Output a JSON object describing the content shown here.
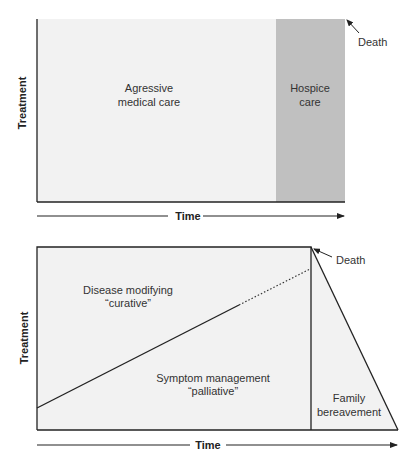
{
  "colors": {
    "background": "#ffffff",
    "region_fill": "#f2f2f2",
    "hospice_fill": "#c0c0c0",
    "line": "#222222",
    "text": "#333333"
  },
  "top_diagram": {
    "y_axis_label": "Treatment",
    "x_axis_label": "Time",
    "regions": [
      {
        "id": "aggressive",
        "line1": "Agressive",
        "line2": "medical care"
      },
      {
        "id": "hospice",
        "line1": "Hospice",
        "line2": "care"
      }
    ],
    "annotation": "Death"
  },
  "bottom_diagram": {
    "y_axis_label": "Treatment",
    "x_axis_label": "Time",
    "regions": [
      {
        "id": "curative",
        "line1": "Disease modifying",
        "line2": "“curative”"
      },
      {
        "id": "palliative",
        "line1": "Symptom management",
        "line2": "“palliative”"
      },
      {
        "id": "bereavement",
        "line1": "Family",
        "line2": "bereavement"
      }
    ],
    "annotation": "Death"
  }
}
